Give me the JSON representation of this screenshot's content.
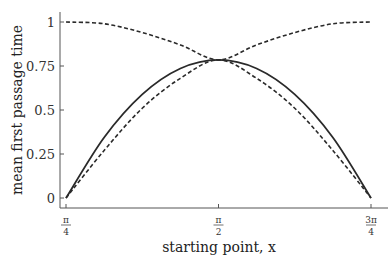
{
  "chart_data": {
    "type": "line",
    "title": "",
    "xlabel": "starting point, x",
    "ylabel": "mean first passage time",
    "xlim": [
      0.7854,
      2.3562
    ],
    "ylim": [
      0,
      1
    ],
    "grid": false,
    "legend": null,
    "x_ticks": [
      {
        "value": 0.7854,
        "num": "π",
        "den": "4"
      },
      {
        "value": 1.5708,
        "num": "π",
        "den": "2"
      },
      {
        "value": 2.3562,
        "num": "3π",
        "den": "4"
      }
    ],
    "y_ticks": [
      {
        "value": 0,
        "label": "0"
      },
      {
        "value": 0.25,
        "label": "0.25"
      },
      {
        "value": 0.5,
        "label": "0.5"
      },
      {
        "value": 0.75,
        "label": "0.75"
      },
      {
        "value": 1,
        "label": "1"
      }
    ],
    "x": [
      0.7854,
      0.9817,
      1.1781,
      1.3744,
      1.5708,
      1.7671,
      1.9635,
      2.1598,
      2.3562
    ],
    "series": [
      {
        "name": "solid",
        "style": "solid",
        "values": [
          0,
          0.344,
          0.589,
          0.736,
          0.785,
          0.736,
          0.589,
          0.344,
          0
        ]
      },
      {
        "name": "dashed-upper",
        "style": "dashed",
        "values": [
          1,
          0.99,
          0.94,
          0.87,
          0.785,
          0.87,
          0.94,
          0.99,
          1
        ]
      },
      {
        "name": "dashed-lower",
        "style": "dashed",
        "values": [
          0,
          0.27,
          0.51,
          0.68,
          0.785,
          0.68,
          0.51,
          0.27,
          0
        ]
      }
    ]
  }
}
